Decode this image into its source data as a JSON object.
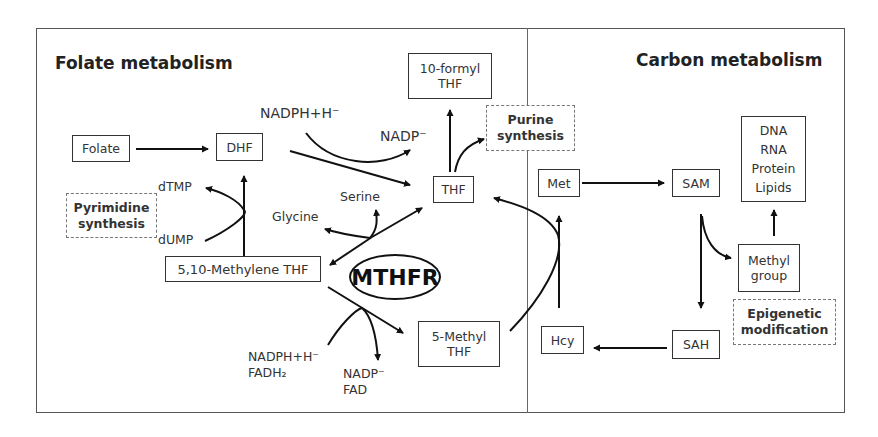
{
  "panels": {
    "left_title": "Folate metabolism",
    "right_title": "Carbon metabolism"
  },
  "nodes": {
    "folate": "Folate",
    "dhf": "DHF",
    "thf": "THF",
    "formyl_thf": "10-formyl\nTHF",
    "methylene_thf": "5,10-Methylene THF",
    "methyl_thf": "5-Methyl\nTHF",
    "met": "Met",
    "sam": "SAM",
    "sah": "SAH",
    "hcy": "Hcy",
    "macromolecules": "DNA\nRNA\nProtein\nLipids",
    "methyl_group": "Methyl\ngroup"
  },
  "processes": {
    "purine": "Purine\nsynthesis",
    "pyrimidine": "Pyrimidine\nsynthesis",
    "epigenetic": "Epigenetic\nmodification"
  },
  "enzyme": "MTHFR",
  "cofactors": {
    "nadph_top": "NADPH+H⁻",
    "nadp_top": "NADP⁻",
    "dtmp": "dTMP",
    "dump": "dUMP",
    "serine": "Serine",
    "glycine": "Glycine",
    "nadph_bottom": "NADPH+H⁻\nFADH₂",
    "nadp_bottom": "NADP⁻\nFAD"
  }
}
